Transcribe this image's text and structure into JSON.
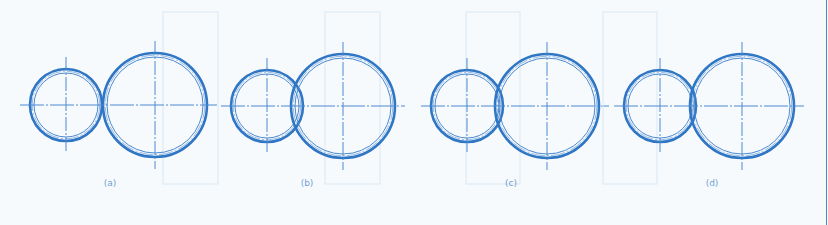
{
  "colors": {
    "background": "#f7fafd",
    "line": "#2f76c4",
    "thin_line": "#4d8ad0",
    "ghost": "#d9e6f3",
    "caption": "#6f9fd0"
  },
  "figures": [
    {
      "label": "(a)",
      "relation": "tangent",
      "small": {
        "cx": 66,
        "cy": 105,
        "r": 36
      },
      "large": {
        "cx": 155,
        "cy": 105,
        "r": 52
      },
      "caption_x": 110,
      "ghost_rect": {
        "x": 163,
        "y": 12,
        "w": 55,
        "h": 172
      }
    },
    {
      "label": "(b)",
      "relation": "overlapping",
      "small": {
        "cx": 267,
        "cy": 106,
        "r": 36
      },
      "large": {
        "cx": 343,
        "cy": 106,
        "r": 52
      },
      "caption_x": 307,
      "ghost_rect": {
        "x": 325,
        "y": 12,
        "w": 55,
        "h": 172
      }
    },
    {
      "label": "(c)",
      "relation": "tangent",
      "small": {
        "cx": 467,
        "cy": 106,
        "r": 36
      },
      "large": {
        "cx": 547,
        "cy": 106,
        "r": 52
      },
      "caption_x": 511,
      "ghost_rect": {
        "x": 466,
        "y": 12,
        "w": 54,
        "h": 172
      }
    },
    {
      "label": "(d)",
      "relation": "overlapping",
      "small": {
        "cx": 660,
        "cy": 106,
        "r": 36
      },
      "large": {
        "cx": 742,
        "cy": 106,
        "r": 52
      },
      "caption_x": 712,
      "ghost_rect": {
        "x": 603,
        "y": 12,
        "w": 54,
        "h": 172
      }
    }
  ],
  "caption_y": 178
}
